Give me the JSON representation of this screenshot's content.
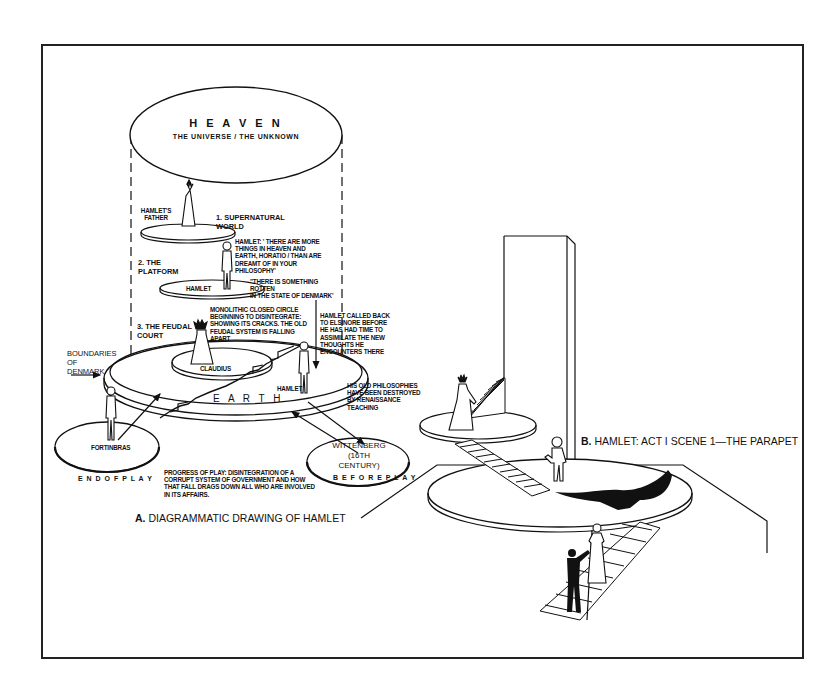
{
  "diagram_a": {
    "caption_prefix": "A.",
    "caption": "DIAGRAMMATIC DRAWING OF HAMLET",
    "heaven": {
      "title": "H E A V E N",
      "subtitle": "THE UNIVERSE / THE UNKNOWN"
    },
    "levels": [
      {
        "label_line1": "1.  SUPERNATURAL",
        "label_line2": "WORLD",
        "figure": "HAMLET'S FATHER",
        "figure_line1": "HAMLET'S",
        "figure_line2": "FATHER"
      },
      {
        "label_line1": "2.  THE",
        "label_line2": "PLATFORM",
        "figure": "HAMLET"
      },
      {
        "label_line1": "3.  THE FEUDAL",
        "label_line2": "COURT",
        "figure": "CLAUDIUS"
      }
    ],
    "quotes": {
      "hamlet_quote": [
        "HAMLET: ' THERE ARE MORE",
        "THINGS IN HEAVEN AND",
        "EARTH, HORATIO / THAN ARE",
        "DREAMT OF IN  YOUR",
        "PHILOSOPHY'"
      ],
      "rotten_quote": [
        "\"THERE IS SOMETHING",
        "ROTTEN",
        " IN THE STATE OF DENMARK'"
      ]
    },
    "notes": {
      "monolithic": [
        "MONOLITHIC CLOSED CIRCLE",
        "BEGINNING TO DISINTEGRATE:",
        "SHOWING ITS CRACKS. THE OLD",
        "FEUDAL SYSTEM IS FALLING",
        "APART"
      ],
      "called_back": [
        "HAMLET CALLED BACK",
        "TO ELSINORE BEFORE",
        "HE HAS HAD TIME TO",
        "ASSIMILATE THE NEW",
        "THOUGHTS HE",
        "ENCOUNTERS THERE"
      ],
      "old_philosophies": [
        "HIS OLD PHILOSOPHIES",
        "HAVE BEEN DESTROYED",
        "BY  RENAISSANCE",
        "TEACHING"
      ],
      "boundaries": [
        "BOUNDARIES",
        "OF",
        "DENMARK"
      ],
      "progress": [
        "PROGRESS OF PLAY:  DISINTEGRATION OF A",
        "CORRUPT SYSTEM OF GOVERNMENT AND HOW",
        "THAT FALL DRAGS DOWN ALL WHO ARE INVOLVED",
        "IN ITS AFFAIRS."
      ]
    },
    "earth": "E A R T H",
    "hamlet_earth": "HAMLET",
    "fortinbras": "FORTINBRAS",
    "end_of_play": "E N D   O F   P L A Y",
    "wittenberg": {
      "line1": "WITTENBERG",
      "line2": "(16TH CENTURY)"
    },
    "before_play": "B E F O R E   P L A Y"
  },
  "diagram_b": {
    "caption_prefix": "B.",
    "caption": "HAMLET: ACT I SCENE 1—THE PARAPET"
  },
  "colors": {
    "ink": "#111111",
    "paper": "#ffffff",
    "frame": "#222222"
  }
}
